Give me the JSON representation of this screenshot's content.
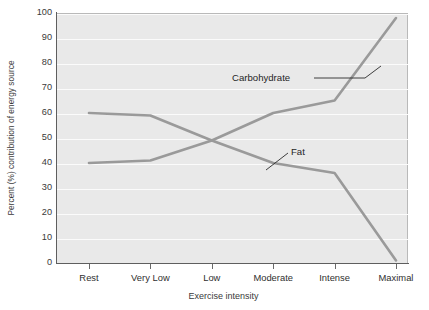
{
  "chart_data": {
    "type": "line",
    "title": "",
    "xlabel": "Exercise intensity",
    "ylabel": "Percent (%) contribution of energy source",
    "categories": [
      "Rest",
      "Very Low",
      "Low",
      "Moderate",
      "Intense",
      "Maximal"
    ],
    "yticks": [
      0,
      10,
      20,
      30,
      40,
      50,
      60,
      70,
      80,
      90,
      100
    ],
    "ytick_labels": [
      "0",
      "10",
      "20",
      "30",
      "40",
      "50",
      "60",
      "70",
      "80",
      "90",
      "100"
    ],
    "ylim": [
      0,
      100
    ],
    "grid": true,
    "grid_color": "#fbfbfb",
    "plot_bg": "#e9e9e9",
    "legend_position": "inline-annotations",
    "series": [
      {
        "name": "Carbohydrate",
        "color": "#9a9a9a",
        "values": [
          40,
          41,
          49,
          60,
          65,
          98
        ],
        "annotation": "Carbohydrate"
      },
      {
        "name": "Fat",
        "color": "#9a9a9a",
        "values": [
          60,
          59,
          49,
          40,
          36,
          1
        ],
        "annotation": "Fat"
      }
    ],
    "annotations": [
      {
        "text": "Carbohydrate",
        "points_to": "Maximal-rise-segment"
      },
      {
        "text": "Fat",
        "points_to": "Moderate-segment"
      }
    ]
  }
}
